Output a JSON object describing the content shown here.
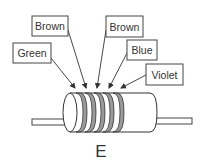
{
  "diagram": {
    "caption": "E",
    "labels": [
      {
        "text": "Green",
        "box": [
          13,
          43,
          38,
          20
        ],
        "arrow_from": [
          51,
          58
        ],
        "arrow_to": [
          75,
          88
        ]
      },
      {
        "text": "Brown",
        "box": [
          32,
          16,
          36,
          20
        ],
        "arrow_from": [
          68,
          30
        ],
        "arrow_to": [
          86,
          88
        ]
      },
      {
        "text": "Brown",
        "box": [
          106,
          16,
          37,
          21
        ],
        "arrow_from": [
          106,
          30
        ],
        "arrow_to": [
          97,
          88
        ]
      },
      {
        "text": "Blue",
        "box": [
          127,
          40,
          30,
          20
        ],
        "arrow_from": [
          127,
          53
        ],
        "arrow_to": [
          108,
          88
        ]
      },
      {
        "text": "Violet",
        "box": [
          146,
          64,
          37,
          21
        ],
        "arrow_from": [
          146,
          75
        ],
        "arrow_to": [
          120,
          88
        ]
      }
    ],
    "resistor": {
      "bands": 5,
      "band_color": "#9a9a9a",
      "outline_color": "#333333"
    }
  }
}
